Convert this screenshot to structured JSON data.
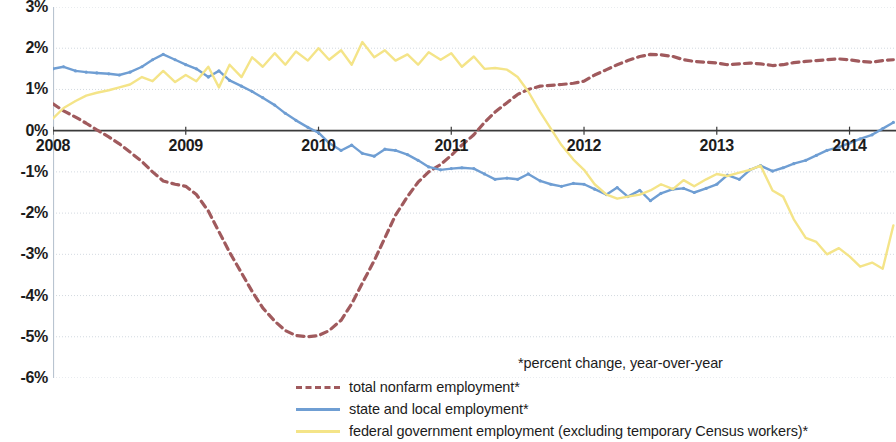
{
  "footnote": "*percent change, year-over-year",
  "axes": {
    "y_ticks": [
      "3%",
      "2%",
      "1%",
      "0%",
      "-1%",
      "-2%",
      "-3%",
      "-4%",
      "-5%",
      "-6%"
    ],
    "x_ticks": [
      "2008",
      "2009",
      "2010",
      "2011",
      "2012",
      "2013",
      "2014"
    ]
  },
  "legend": {
    "items": [
      {
        "label": "total nonfarm employment*",
        "color": "#a05a5d",
        "style": "dashed"
      },
      {
        "label": "state and local employment*",
        "color": "#6f9ed3",
        "style": "solid"
      },
      {
        "label": "federal government employment (excluding temporary Census workers)*",
        "color": "#f4e488",
        "style": "solid"
      }
    ]
  },
  "chart_data": {
    "type": "line",
    "title": "",
    "subtitle": "",
    "xlabel": "",
    "ylabel": "",
    "xlim": [
      2008.0,
      2014.35
    ],
    "ylim": [
      -6,
      3
    ],
    "ytick_values": [
      3,
      2,
      1,
      0,
      -1,
      -2,
      -3,
      -4,
      -5,
      -6
    ],
    "xtick_values": [
      2008,
      2009,
      2010,
      2011,
      2012,
      2013,
      2014
    ],
    "grid": true,
    "grid_axis": "y",
    "zero_line": true,
    "legend_position": "bottom",
    "units": "percent change, year-over-year",
    "series": [
      {
        "name": "total nonfarm employment*",
        "color": "#a05a5d",
        "style": "dashed",
        "x": [
          2008.0,
          2008.08,
          2008.17,
          2008.25,
          2008.33,
          2008.42,
          2008.5,
          2008.58,
          2008.67,
          2008.75,
          2008.83,
          2008.92,
          2009.0,
          2009.08,
          2009.17,
          2009.25,
          2009.33,
          2009.42,
          2009.5,
          2009.58,
          2009.67,
          2009.75,
          2009.83,
          2009.92,
          2010.0,
          2010.08,
          2010.17,
          2010.25,
          2010.33,
          2010.42,
          2010.5,
          2010.58,
          2010.67,
          2010.75,
          2010.83,
          2010.92,
          2011.0,
          2011.08,
          2011.17,
          2011.25,
          2011.33,
          2011.42,
          2011.5,
          2011.58,
          2011.67,
          2011.75,
          2011.83,
          2011.92,
          2012.0,
          2012.08,
          2012.17,
          2012.25,
          2012.33,
          2012.42,
          2012.5,
          2012.58,
          2012.67,
          2012.75,
          2012.83,
          2012.92,
          2013.0,
          2013.08,
          2013.17,
          2013.25,
          2013.33,
          2013.42,
          2013.5,
          2013.58,
          2013.67,
          2013.75,
          2013.83,
          2013.92,
          2014.0,
          2014.08,
          2014.17,
          2014.25,
          2014.33
        ],
        "y": [
          0.65,
          0.48,
          0.33,
          0.18,
          0.02,
          -0.15,
          -0.32,
          -0.52,
          -0.75,
          -1.0,
          -1.22,
          -1.3,
          -1.35,
          -1.55,
          -1.95,
          -2.45,
          -2.95,
          -3.45,
          -3.9,
          -4.3,
          -4.62,
          -4.85,
          -4.97,
          -5.0,
          -4.97,
          -4.85,
          -4.6,
          -4.2,
          -3.7,
          -3.15,
          -2.6,
          -2.05,
          -1.6,
          -1.25,
          -1.0,
          -0.82,
          -0.6,
          -0.35,
          -0.1,
          0.2,
          0.45,
          0.68,
          0.88,
          1.0,
          1.08,
          1.1,
          1.12,
          1.15,
          1.2,
          1.35,
          1.48,
          1.6,
          1.7,
          1.8,
          1.85,
          1.84,
          1.8,
          1.72,
          1.68,
          1.66,
          1.64,
          1.6,
          1.62,
          1.64,
          1.62,
          1.58,
          1.6,
          1.65,
          1.68,
          1.7,
          1.72,
          1.74,
          1.72,
          1.68,
          1.66,
          1.7,
          1.72
        ]
      },
      {
        "name": "state and local employment*",
        "color": "#6f9ed3",
        "style": "solid",
        "x": [
          2008.0,
          2008.08,
          2008.17,
          2008.25,
          2008.33,
          2008.42,
          2008.5,
          2008.58,
          2008.67,
          2008.75,
          2008.83,
          2008.92,
          2009.0,
          2009.08,
          2009.17,
          2009.25,
          2009.33,
          2009.42,
          2009.5,
          2009.58,
          2009.67,
          2009.75,
          2009.83,
          2009.92,
          2010.0,
          2010.08,
          2010.17,
          2010.25,
          2010.33,
          2010.42,
          2010.5,
          2010.58,
          2010.67,
          2010.75,
          2010.83,
          2010.92,
          2011.0,
          2011.08,
          2011.17,
          2011.25,
          2011.33,
          2011.42,
          2011.5,
          2011.58,
          2011.67,
          2011.75,
          2011.83,
          2011.92,
          2012.0,
          2012.08,
          2012.17,
          2012.25,
          2012.33,
          2012.42,
          2012.5,
          2012.58,
          2012.67,
          2012.75,
          2012.83,
          2012.92,
          2013.0,
          2013.08,
          2013.17,
          2013.25,
          2013.33,
          2013.42,
          2013.5,
          2013.58,
          2013.67,
          2013.75,
          2013.83,
          2013.92,
          2014.0,
          2014.08,
          2014.17,
          2014.25,
          2014.33
        ],
        "y": [
          1.5,
          1.55,
          1.45,
          1.42,
          1.4,
          1.38,
          1.35,
          1.42,
          1.55,
          1.72,
          1.85,
          1.72,
          1.6,
          1.5,
          1.3,
          1.45,
          1.22,
          1.08,
          0.95,
          0.8,
          0.62,
          0.42,
          0.25,
          0.08,
          -0.05,
          -0.3,
          -0.48,
          -0.35,
          -0.55,
          -0.62,
          -0.45,
          -0.48,
          -0.58,
          -0.72,
          -0.88,
          -0.95,
          -0.92,
          -0.9,
          -0.92,
          -1.05,
          -1.18,
          -1.15,
          -1.18,
          -1.05,
          -1.22,
          -1.3,
          -1.35,
          -1.28,
          -1.3,
          -1.42,
          -1.55,
          -1.38,
          -1.6,
          -1.45,
          -1.7,
          -1.52,
          -1.42,
          -1.4,
          -1.5,
          -1.4,
          -1.3,
          -1.08,
          -1.18,
          -0.95,
          -0.85,
          -0.98,
          -0.9,
          -0.8,
          -0.72,
          -0.6,
          -0.48,
          -0.4,
          -0.3,
          -0.2,
          -0.1,
          0.05,
          0.2
        ],
        "note": "continues: 0.25, 0.18, 0.22, 0.30, 0.35, 0.42 to right edge"
      },
      {
        "name": "federal government employment (excluding temporary Census workers)*",
        "color": "#f4e488",
        "style": "solid",
        "x": [
          2008.0,
          2008.08,
          2008.17,
          2008.25,
          2008.33,
          2008.42,
          2008.5,
          2008.58,
          2008.67,
          2008.75,
          2008.83,
          2008.92,
          2009.0,
          2009.08,
          2009.17,
          2009.25,
          2009.33,
          2009.42,
          2009.5,
          2009.58,
          2009.67,
          2009.75,
          2009.83,
          2009.92,
          2010.0,
          2010.08,
          2010.17,
          2010.25,
          2010.33,
          2010.42,
          2010.5,
          2010.58,
          2010.67,
          2010.75,
          2010.83,
          2010.92,
          2011.0,
          2011.08,
          2011.17,
          2011.25,
          2011.33,
          2011.42,
          2011.5,
          2011.58,
          2011.67,
          2011.75,
          2011.83,
          2011.92,
          2012.0,
          2012.08,
          2012.17,
          2012.25,
          2012.33,
          2012.42,
          2012.5,
          2012.58,
          2012.67,
          2012.75,
          2012.83,
          2012.92,
          2013.0,
          2013.08,
          2013.17,
          2013.25,
          2013.33,
          2013.42,
          2013.5,
          2013.58,
          2013.67,
          2013.75,
          2013.83,
          2013.92,
          2014.0,
          2014.08,
          2014.17,
          2014.25,
          2014.33
        ],
        "y": [
          0.3,
          0.55,
          0.72,
          0.85,
          0.92,
          0.98,
          1.05,
          1.12,
          1.3,
          1.2,
          1.45,
          1.18,
          1.35,
          1.2,
          1.55,
          1.05,
          1.6,
          1.3,
          1.78,
          1.55,
          1.88,
          1.6,
          1.92,
          1.7,
          2.0,
          1.72,
          1.95,
          1.6,
          2.15,
          1.78,
          1.95,
          1.7,
          1.85,
          1.6,
          1.9,
          1.72,
          1.88,
          1.55,
          1.8,
          1.5,
          1.52,
          1.48,
          1.3,
          0.95,
          0.45,
          0.05,
          -0.35,
          -0.7,
          -0.95,
          -1.3,
          -1.55,
          -1.65,
          -1.6,
          -1.55,
          -1.45,
          -1.3,
          -1.42,
          -1.2,
          -1.35,
          -1.18,
          -1.05,
          -1.1,
          -1.02,
          -0.95,
          -0.85,
          -1.45,
          -1.6,
          -2.15,
          -2.6,
          -2.7,
          -3.0,
          -2.85,
          -3.05,
          -3.3,
          -3.2,
          -3.35,
          -2.3
        ]
      }
    ]
  }
}
